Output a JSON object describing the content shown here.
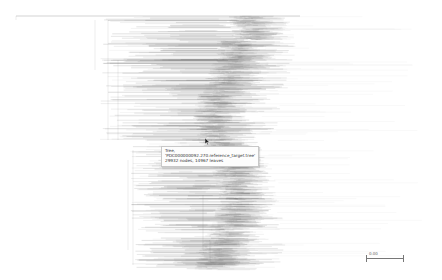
{
  "viewer": {
    "type": "phylogenetic-tree-view",
    "background": "#ffffff",
    "branch_color": "#555555"
  },
  "tooltip": {
    "line1": "Tree,",
    "line2": "'PDC000000092.270.reference_target.tree'",
    "line3": "29932 nodes, 14967 leaves"
  },
  "scale_bar": {
    "label": "0.00"
  }
}
